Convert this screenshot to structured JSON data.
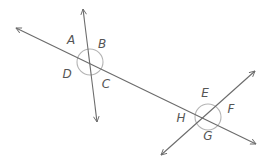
{
  "diagram": {
    "type": "transversal-intersecting-lines",
    "colors": {
      "line": "#6b6b6b",
      "arc": "#b4b4b4",
      "label": "#555555",
      "background": "#ffffff"
    },
    "lines": [
      {
        "id": "transversal",
        "x1": 16,
        "y1": 28,
        "x2": 256,
        "y2": 144,
        "arrow_start": true,
        "arrow_end": true
      },
      {
        "id": "line-1",
        "x1": 83,
        "y1": 9,
        "x2": 97,
        "y2": 122,
        "arrow_start": true,
        "arrow_end": true
      },
      {
        "id": "line-2",
        "x1": 255,
        "y1": 71,
        "x2": 161,
        "y2": 155,
        "arrow_start": true,
        "arrow_end": true
      }
    ],
    "intersections": [
      {
        "id": "intersection-1",
        "cx": 90,
        "cy": 62,
        "r": 13
      },
      {
        "id": "intersection-2",
        "cx": 208,
        "cy": 117,
        "r": 13
      }
    ],
    "angle_labels": [
      {
        "text": "A",
        "x": 71,
        "y": 40
      },
      {
        "text": "B",
        "x": 102,
        "y": 44
      },
      {
        "text": "C",
        "x": 106,
        "y": 84
      },
      {
        "text": "D",
        "x": 67,
        "y": 74
      },
      {
        "text": "E",
        "x": 205,
        "y": 93
      },
      {
        "text": "F",
        "x": 231,
        "y": 109
      },
      {
        "text": "G",
        "x": 208,
        "y": 136
      },
      {
        "text": "H",
        "x": 181,
        "y": 118
      }
    ]
  }
}
